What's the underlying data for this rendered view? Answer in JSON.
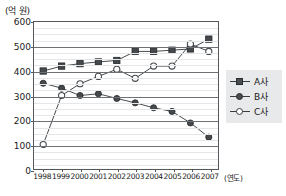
{
  "chart_data": {
    "type": "line",
    "title": "",
    "subtitle": "",
    "unit_label": "(억 원)",
    "xlabel": "(연도)",
    "ylabel": "",
    "categories": [
      "1998",
      "1999",
      "2000",
      "2001",
      "2002",
      "2003",
      "2004",
      "2005",
      "2006",
      "2007"
    ],
    "ylim": [
      0,
      600
    ],
    "yticks": [
      0,
      100,
      200,
      300,
      400,
      500,
      600
    ],
    "ytick_labels": [
      "0",
      "100",
      "200",
      "300",
      "400",
      "500",
      "600"
    ],
    "y_minor_step": 25,
    "grid": true,
    "legend_position": "right",
    "series": [
      {
        "name": "A사",
        "marker": "filled-square",
        "color": "#46494c",
        "values": [
          400,
          420,
          430,
          437,
          443,
          480,
          480,
          485,
          490,
          530
        ]
      },
      {
        "name": "B사",
        "marker": "filled-circle",
        "color": "#46494c",
        "values": [
          350,
          330,
          300,
          307,
          288,
          270,
          250,
          235,
          188,
          130
        ]
      },
      {
        "name": "C사",
        "marker": "open-circle",
        "color": "#46494c",
        "values": [
          100,
          300,
          348,
          378,
          407,
          370,
          420,
          420,
          510,
          480
        ]
      }
    ]
  },
  "legend": {
    "items": [
      {
        "label": "A사",
        "marker": "filled-square"
      },
      {
        "label": "B사",
        "marker": "filled-circle"
      },
      {
        "label": "C사",
        "marker": "open-circle"
      }
    ]
  },
  "colors": {
    "axis": "#55585c",
    "grid_major": "#6e7276",
    "grid_minor": "#e4e6e8",
    "series": "#46494c",
    "legend_background": "#e8e9ea",
    "text": "#1a1a1a"
  }
}
